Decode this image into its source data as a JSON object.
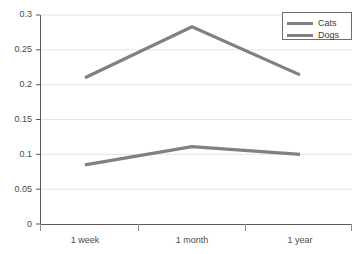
{
  "chart_data": {
    "type": "line",
    "title": "",
    "xlabel": "",
    "ylabel": "",
    "categories": [
      "1 week",
      "1 month",
      "1 year"
    ],
    "series": [
      {
        "name": "Cats",
        "values": [
          0.21,
          0.283,
          0.214
        ],
        "color": "#808080"
      },
      {
        "name": "Dogs",
        "values": [
          0.085,
          0.111,
          0.1
        ],
        "color": "#808080"
      }
    ],
    "ylim": [
      0,
      0.3
    ],
    "ytick_labels": [
      "0",
      "0.05",
      "0.1",
      "0.15",
      "0.2",
      "0.25",
      "0.3"
    ],
    "ytick_values": [
      0,
      0.05,
      0.1,
      0.15,
      0.2,
      0.25,
      0.3
    ],
    "grid": true,
    "grid_axis": "y",
    "legend_position": "top-right",
    "background_color": "#ffffff",
    "grid_color": "#e3e3e3",
    "axis_color": "#595959"
  },
  "legend": {
    "entries": [
      {
        "label": "Cats"
      },
      {
        "label": "Dogs"
      }
    ]
  },
  "axes": {
    "y_labels": [
      "0.3",
      "0.25",
      "0.2",
      "0.15",
      "0.1",
      "0.05",
      "0"
    ],
    "x_labels": [
      "1 week",
      "1 month",
      "1 year"
    ]
  }
}
